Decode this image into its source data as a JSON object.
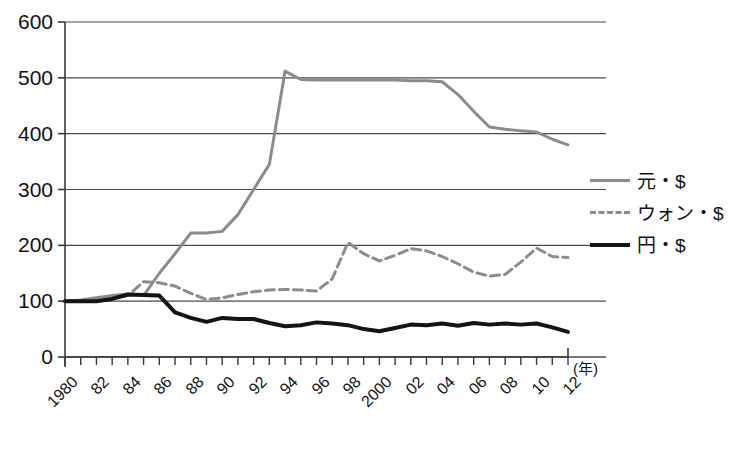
{
  "chart_data": {
    "type": "line",
    "title": "",
    "xlabel": "(年)",
    "ylabel": "",
    "ylim": [
      0,
      600
    ],
    "ytick_values": [
      0,
      100,
      200,
      300,
      400,
      500,
      600
    ],
    "ytick_labels": [
      "0",
      "100",
      "200",
      "300",
      "400",
      "500",
      "600"
    ],
    "grid": true,
    "legend_position": "right",
    "x": [
      1980,
      1981,
      1982,
      1983,
      1984,
      1985,
      1986,
      1987,
      1988,
      1989,
      1990,
      1991,
      1992,
      1993,
      1994,
      1995,
      1996,
      1997,
      1998,
      1999,
      2000,
      2001,
      2002,
      2003,
      2004,
      2005,
      2006,
      2007,
      2008,
      2009,
      2010,
      2011,
      2012
    ],
    "xtick_labels": [
      "1980",
      "",
      "82",
      "",
      "84",
      "",
      "86",
      "",
      "88",
      "",
      "90",
      "",
      "92",
      "",
      "94",
      "",
      "96",
      "",
      "98",
      "",
      "2000",
      "",
      "02",
      "",
      "04",
      "",
      "06",
      "",
      "08",
      "",
      "10",
      "",
      "12"
    ],
    "xtick_labels_shown": [
      "1980",
      "82",
      "84",
      "86",
      "88",
      "90",
      "92",
      "94",
      "96",
      "98",
      "2000",
      "02",
      "04",
      "06",
      "08",
      "10",
      "12"
    ],
    "series": [
      {
        "name": "元・$",
        "color": "#8c8c8c",
        "style": "solid",
        "width": 3,
        "values": [
          100,
          102,
          106,
          110,
          113,
          110,
          150,
          185,
          222,
          222,
          225,
          255,
          300,
          345,
          512,
          497,
          496,
          496,
          496,
          496,
          496,
          496,
          495,
          495,
          493,
          470,
          440,
          412,
          408,
          405,
          403,
          390,
          380
        ]
      },
      {
        "name": "ウォン・$",
        "color": "#8c8c8c",
        "style": "dashed",
        "width": 3,
        "values": [
          100,
          101,
          103,
          105,
          110,
          135,
          133,
          127,
          114,
          103,
          106,
          112,
          117,
          120,
          121,
          120,
          118,
          140,
          205,
          185,
          172,
          182,
          194,
          190,
          180,
          167,
          152,
          145,
          148,
          170,
          195,
          180,
          178
        ]
      },
      {
        "name": "円・$",
        "color": "#141414",
        "style": "solid",
        "width": 4,
        "values": [
          100,
          100,
          100,
          104,
          112,
          111,
          110,
          80,
          70,
          63,
          70,
          68,
          68,
          61,
          55,
          57,
          62,
          60,
          57,
          50,
          46,
          52,
          58,
          57,
          60,
          56,
          61,
          58,
          60,
          58,
          60,
          53,
          45
        ]
      }
    ]
  },
  "axes": {
    "y_labels": [
      "600",
      "500",
      "400",
      "300",
      "200",
      "100",
      "0"
    ],
    "x_labels": [
      "1980",
      "82",
      "84",
      "86",
      "88",
      "90",
      "92",
      "94",
      "96",
      "98",
      "2000",
      "02",
      "04",
      "06",
      "08",
      "10",
      "12"
    ],
    "x_unit": "(年)"
  },
  "legend": {
    "items": [
      {
        "label": "元・$",
        "swatch": "solid-gray-line-icon"
      },
      {
        "label": "ウォン・$",
        "swatch": "dashed-gray-line-icon"
      },
      {
        "label": "円・$",
        "swatch": "solid-black-line-icon"
      }
    ]
  },
  "colors": {
    "gray_series": "#8c8c8c",
    "black_series": "#141414",
    "gridline": "#4a4a4a",
    "axis": "#3a3a3a",
    "background": "#ffffff"
  }
}
